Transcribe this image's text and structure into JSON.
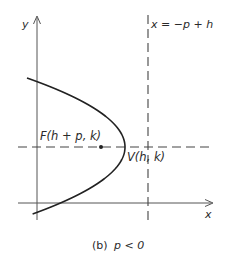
{
  "figure": {
    "caption": "(b) p < 0",
    "caption_prefix": "(b)",
    "caption_condition": "p < 0"
  },
  "axes": {
    "x_label": "x",
    "y_label": "y"
  },
  "directrix": {
    "label": "x = −p + h"
  },
  "focus": {
    "label": "F(h + p, k)"
  },
  "vertex": {
    "label": "V(h, k)"
  },
  "colors": {
    "ink": "#2a2a2a",
    "axis": "#555555",
    "background": "#ffffff"
  }
}
